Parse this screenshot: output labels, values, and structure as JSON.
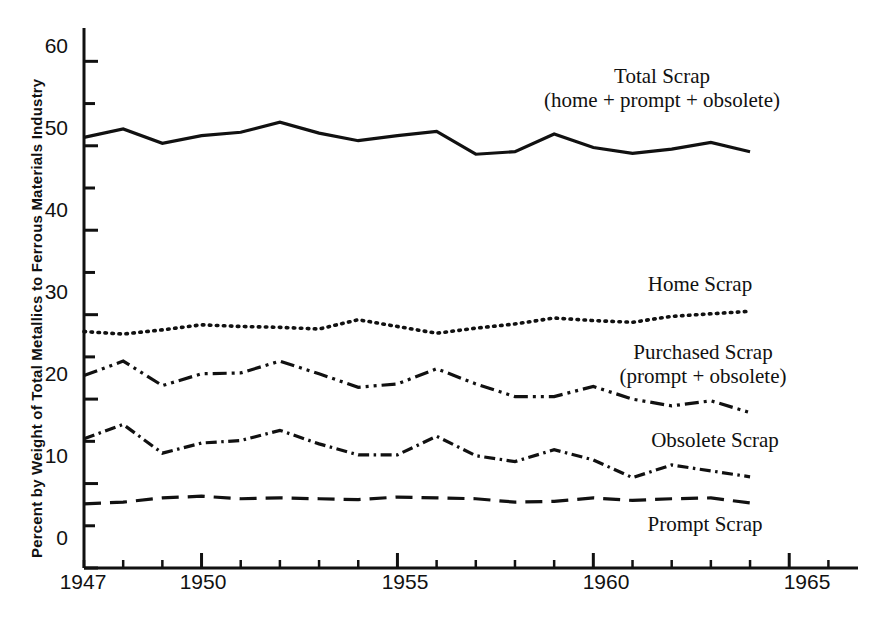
{
  "chart_data": {
    "type": "line",
    "title": "",
    "xlabel": "",
    "ylabel": "Percent by Weight of Total Metallics to Ferrous Materials Industry",
    "xlim": [
      1947,
      1966.5
    ],
    "ylim": [
      0,
      63
    ],
    "grid": false,
    "legend_position": "inline-annotations",
    "x_ticks_major": [
      1950,
      1955,
      1960,
      1965
    ],
    "x_tick_labels": [
      "1947",
      "1950",
      "1955",
      "1960",
      "1965"
    ],
    "x_tick_label_values": [
      1947,
      1950,
      1955,
      1960,
      1965
    ],
    "x_ticks_minor_step": 1,
    "y_ticks_major": [
      0,
      10,
      20,
      30,
      40,
      50,
      60
    ],
    "y_tick_labels": [
      "0",
      "10",
      "20",
      "30",
      "40",
      "50",
      "60"
    ],
    "y_ticks_minor": [
      5,
      15,
      25,
      35,
      45,
      55
    ],
    "x": [
      1947,
      1948,
      1949,
      1950,
      1951,
      1952,
      1953,
      1954,
      1955,
      1956,
      1957,
      1958,
      1959,
      1960,
      1961,
      1962,
      1963,
      1964
    ],
    "series": [
      {
        "name": "Total Scrap",
        "label": "Total Scrap",
        "sublabel": "(home + prompt + obsolete)",
        "linestyle": "solid",
        "color": "#111111",
        "values": [
          51.0,
          52.0,
          50.3,
          51.2,
          51.6,
          52.8,
          51.5,
          50.6,
          51.2,
          51.7,
          49.0,
          49.3,
          51.4,
          49.8,
          49.1,
          49.6,
          50.4,
          49.3
        ]
      },
      {
        "name": "Home Scrap",
        "label": "Home  Scrap",
        "sublabel": "",
        "linestyle": "dotted",
        "color": "#111111",
        "values": [
          28.0,
          27.7,
          28.2,
          28.8,
          28.6,
          28.5,
          28.3,
          29.4,
          28.6,
          27.8,
          28.4,
          28.9,
          29.6,
          29.3,
          29.1,
          29.8,
          30.1,
          30.4
        ]
      },
      {
        "name": "Purchased Scrap",
        "label": "Purchased Scrap",
        "sublabel": "(prompt + obsolete)",
        "linestyle": "dash-dot-dot",
        "color": "#111111",
        "values": [
          22.8,
          24.5,
          21.6,
          23.0,
          23.1,
          24.5,
          23.0,
          21.4,
          21.8,
          23.6,
          21.8,
          20.3,
          20.3,
          21.5,
          20.0,
          19.2,
          19.8,
          18.4
        ]
      },
      {
        "name": "Obsolete Scrap",
        "label": "Obsolete Scrap",
        "sublabel": "",
        "linestyle": "dash-dot",
        "color": "#111111",
        "values": [
          15.3,
          17.0,
          13.6,
          14.8,
          15.1,
          16.3,
          14.7,
          13.4,
          13.4,
          15.6,
          13.3,
          12.6,
          14.0,
          12.8,
          10.7,
          12.2,
          11.5,
          10.8
        ]
      },
      {
        "name": "Prompt Scrap",
        "label": "Prompt  Scrap",
        "sublabel": "",
        "linestyle": "long-dash",
        "color": "#111111",
        "values": [
          7.6,
          7.8,
          8.3,
          8.5,
          8.2,
          8.3,
          8.2,
          8.1,
          8.4,
          8.3,
          8.2,
          7.8,
          7.9,
          8.3,
          8.0,
          8.2,
          8.3,
          7.7
        ]
      }
    ]
  },
  "annotations": {
    "total_scrap": {
      "line1": "Total Scrap",
      "line2": "(home + prompt + obsolete)"
    },
    "home_scrap": {
      "line1": "Home  Scrap"
    },
    "purchased_scrap": {
      "line1": "Purchased Scrap",
      "line2": "(prompt + obsolete)"
    },
    "obsolete_scrap": {
      "line1": "Obsolete Scrap"
    },
    "prompt_scrap": {
      "line1": "Prompt  Scrap"
    }
  },
  "axes": {
    "y_title": "Percent by Weight of Total Metallics to Ferrous Materials Industry",
    "y_labels": [
      "60",
      "50",
      "40",
      "30",
      "20",
      "10",
      "0"
    ],
    "x_labels": [
      "1947",
      "1950",
      "1955",
      "1960",
      "1965"
    ]
  }
}
